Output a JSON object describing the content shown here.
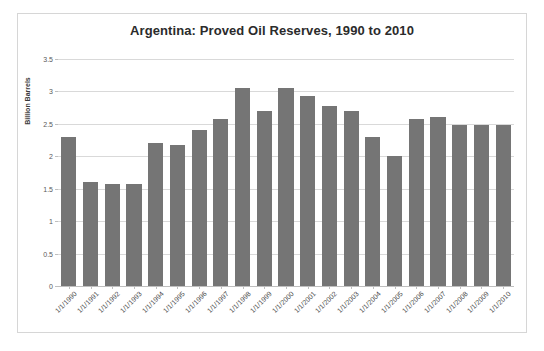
{
  "chart_data": {
    "type": "bar",
    "title": "Argentina: Proved Oil Reserves, 1990 to 2010",
    "xlabel": "",
    "ylabel": "Billion Barrels",
    "ylim": [
      0,
      3.5
    ],
    "y_ticks": [
      "0",
      "0.5",
      "1",
      "1.5",
      "2",
      "2.5",
      "3",
      "3.5"
    ],
    "y_tick_values": [
      0,
      0.5,
      1,
      1.5,
      2,
      2.5,
      3,
      3.5
    ],
    "grid": true,
    "legend": "none",
    "bar_color": "#757575",
    "plot_background": "#ffffff",
    "gridline_color": "#d9d9d9",
    "border_color": "#d6d6d6",
    "categories": [
      "1/1/1990",
      "1/1/1991",
      "1/1/1992",
      "1/1/1993",
      "1/1/1994",
      "1/1/1995",
      "1/1/1996",
      "1/1/1997",
      "1/1/1998",
      "1/1/1999",
      "1/1/2000",
      "1/1/2001",
      "1/1/2002",
      "1/1/2003",
      "1/1/2004",
      "1/1/2005",
      "1/1/2006",
      "1/1/2007",
      "1/1/2008",
      "1/1/2009",
      "1/1/2010"
    ],
    "values": [
      2.3,
      1.6,
      1.58,
      1.58,
      2.2,
      2.18,
      2.4,
      2.58,
      3.05,
      2.7,
      3.05,
      2.93,
      2.78,
      2.7,
      2.3,
      2.0,
      2.58,
      2.6,
      2.48,
      2.48,
      2.48
    ]
  }
}
